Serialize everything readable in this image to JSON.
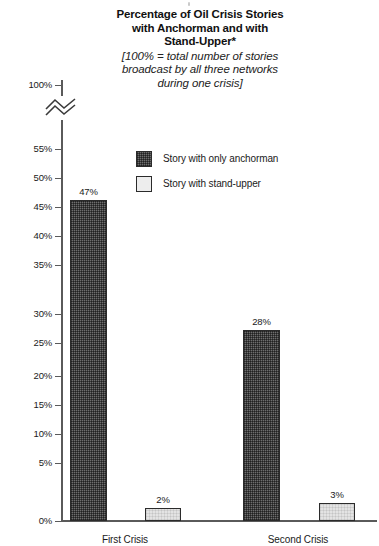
{
  "chart_data": {
    "type": "bar",
    "title": "Percentage of Oil Crisis Stories with Anchorman and with Stand-Upper*",
    "title_lines": [
      "Percentage of Oil Crisis Stories",
      "with Anchorman and with",
      "Stand-Upper*"
    ],
    "subtitle": "[100% = total number of stories broadcast by all three networks during one crisis]",
    "subtitle_lines": [
      "[100% = total number of stories",
      "broadcast by all three networks",
      "during one crisis]"
    ],
    "categories": [
      "First Crisis",
      "Second Crisis"
    ],
    "series": [
      {
        "name": "Story with only anchorman",
        "values": [
          47,
          28
        ],
        "value_labels": [
          "47%",
          "28%"
        ],
        "color": "#6e6e6e",
        "fill": "dark-checkered"
      },
      {
        "name": "Story with stand-upper",
        "values": [
          2,
          3
        ],
        "value_labels": [
          "2%",
          "3%"
        ],
        "color": "#e3e3e3",
        "fill": "light"
      }
    ],
    "xlabel": "",
    "ylabel": "",
    "ylim": [
      0,
      100
    ],
    "y_axis_break": true,
    "y_axis_break_note": "axis broken between 55% and 100%",
    "grid": false,
    "legend_position": "inside-upper-center",
    "yticks": [
      {
        "label": "100%",
        "value": 100,
        "y": 85
      },
      {
        "label": "55%",
        "value": 55,
        "y": 149
      },
      {
        "label": "50%",
        "value": 50,
        "y": 178
      },
      {
        "label": "45%",
        "value": 45,
        "y": 207
      },
      {
        "label": "40%",
        "value": 40,
        "y": 236
      },
      {
        "label": "35%",
        "value": 35,
        "y": 265
      },
      {
        "label": "30%",
        "value": 30,
        "y": 314
      },
      {
        "label": "25%",
        "value": 25,
        "y": 343
      },
      {
        "label": "20%",
        "value": 20,
        "y": 376
      },
      {
        "label": "15%",
        "value": 15,
        "y": 405
      },
      {
        "label": "10%",
        "value": 10,
        "y": 434
      },
      {
        "label": "5%",
        "value": 5,
        "y": 463
      },
      {
        "label": "0%",
        "value": 0,
        "y": 521
      }
    ],
    "bars": [
      {
        "name": "first-crisis-anchorman",
        "label": "47%",
        "x": 70,
        "w": 37,
        "top": 200,
        "style": "dark",
        "label_x": 62,
        "label_y": 186
      },
      {
        "name": "first-crisis-standupper",
        "label": "2%",
        "x": 145,
        "w": 36,
        "top": 508,
        "style": "light",
        "label_x": 137,
        "label_y": 494
      },
      {
        "name": "second-crisis-anchorman",
        "label": "28%",
        "x": 243,
        "w": 37,
        "top": 330,
        "style": "dark",
        "label_x": 235,
        "label_y": 316
      },
      {
        "name": "second-crisis-standupper",
        "label": "3%",
        "x": 319,
        "w": 36,
        "top": 503,
        "style": "light",
        "label_x": 311,
        "label_y": 489
      }
    ],
    "category_labels": [
      {
        "text": "First Crisis",
        "left": 80,
        "width": 90
      },
      {
        "text": "Second Crisis",
        "left": 253,
        "width": 90
      }
    ]
  },
  "axis": {
    "break_icon": "axis-break-zigzag"
  }
}
